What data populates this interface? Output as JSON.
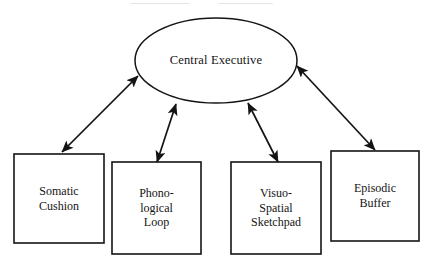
{
  "diagram": {
    "type": "node-link-diagram",
    "background_color": "#ffffff",
    "stroke_color": "#1a1a1a",
    "central_node": {
      "id": "central-executive",
      "shape": "ellipse",
      "label": "Central Executive",
      "cx": 216,
      "cy": 60.5,
      "rx": 81,
      "ry": 42.5
    },
    "boxes": [
      {
        "id": "somatic-cushion",
        "shape": "rectangle",
        "label": "Somatic\nCushion",
        "x": 14,
        "y": 154,
        "width": 90,
        "height": 89
      },
      {
        "id": "phonological-loop",
        "shape": "rectangle",
        "label": "Phono-\nlogical\nLoop",
        "x": 112,
        "y": 162,
        "width": 89,
        "height": 92
      },
      {
        "id": "visuo-spatial-sketchpad",
        "shape": "rectangle",
        "label": "Visuo-\nSpatial\nSketchpad",
        "x": 231,
        "y": 162,
        "width": 90,
        "height": 92
      },
      {
        "id": "episodic-buffer",
        "shape": "rectangle",
        "label": "Episodic\nBuffer",
        "x": 331,
        "y": 151,
        "width": 88,
        "height": 90
      }
    ],
    "connectors": [
      {
        "id": "connector-somatic-cushion",
        "from": "somatic-cushion",
        "to": "central-executive",
        "arrowheads": "both",
        "x1": 62,
        "y1": 152,
        "x2": 138,
        "y2": 76
      },
      {
        "id": "connector-phonological-loop",
        "from": "phonological-loop",
        "to": "central-executive",
        "arrowheads": "both",
        "x1": 157,
        "y1": 162,
        "x2": 176,
        "y2": 104
      },
      {
        "id": "connector-visuo-spatial-sketchpad",
        "from": "visuo-spatial-sketchpad",
        "to": "central-executive",
        "arrowheads": "both",
        "x1": 278,
        "y1": 162,
        "x2": 248,
        "y2": 103
      },
      {
        "id": "connector-episodic-buffer",
        "from": "episodic-buffer",
        "to": "central-executive",
        "arrowheads": "both",
        "x1": 375,
        "y1": 150,
        "x2": 297,
        "y2": 66
      }
    ]
  }
}
